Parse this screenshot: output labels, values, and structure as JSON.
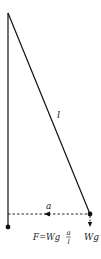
{
  "diagram": {
    "type": "pendulum-force-diagram",
    "labels": {
      "length": "l",
      "displacement": "a",
      "weight": "Wg",
      "force_lhs": "F=Wg",
      "force_frac_num": "a",
      "force_frac_den": "l"
    },
    "points": {
      "pivot": [
        8,
        13
      ],
      "rest_bob": [
        8,
        227
      ],
      "displaced_bob": [
        90,
        214
      ]
    },
    "colors": {
      "line": "#111111",
      "text": "#222222"
    }
  }
}
